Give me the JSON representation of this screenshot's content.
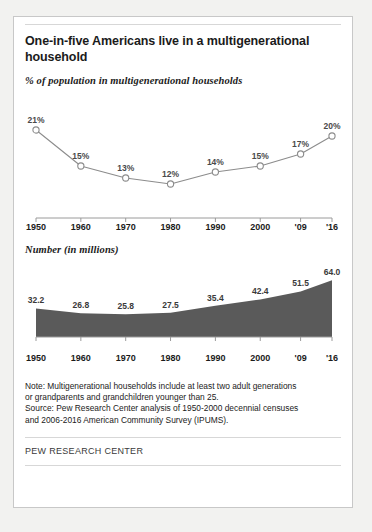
{
  "card": {
    "title": "One-in-five Americans live in a multigenerational household",
    "brand": "PEW RESEARCH CENTER"
  },
  "note": {
    "line1": "Note: Multigenerational households include at least two adult generations",
    "line2": "or grandparents and grandchildren younger than 25.",
    "line3": "Source: Pew Research Center analysis of 1950-2000 decennial censuses",
    "line4": "and 2006-2016 American Community Survey (IPUMS)."
  },
  "colors": {
    "line": "#8c8c8c",
    "marker_fill": "#ffffff",
    "area_fill": "#5a5a5a",
    "label": "#4a4a4a",
    "axis": "#9a9a9a",
    "card_border": "#c8c8c8"
  },
  "chart_data": [
    {
      "type": "line",
      "title": "% of population in multigenerational households",
      "xlabel": "",
      "ylabel": "",
      "categories": [
        "1950",
        "1960",
        "1970",
        "1980",
        "1990",
        "2000",
        "'09",
        "'16"
      ],
      "x": [
        1950,
        1960,
        1970,
        1980,
        1990,
        2000,
        2009,
        2016
      ],
      "values": [
        21,
        15,
        13,
        12,
        14,
        15,
        17,
        20
      ],
      "point_labels": [
        "21%",
        "15%",
        "13%",
        "12%",
        "14%",
        "15%",
        "17%",
        "20%"
      ],
      "ylim": [
        10,
        23
      ],
      "grid": false,
      "legend": "none",
      "marker": "open-circle"
    },
    {
      "type": "area",
      "title": "Number (in millions)",
      "xlabel": "",
      "ylabel": "",
      "categories": [
        "1950",
        "1960",
        "1970",
        "1980",
        "1990",
        "2000",
        "'09",
        "'16"
      ],
      "x": [
        1950,
        1960,
        1970,
        1980,
        1990,
        2000,
        2009,
        2016
      ],
      "values": [
        32.2,
        26.8,
        25.8,
        27.5,
        35.4,
        42.4,
        51.5,
        64.0
      ],
      "point_labels": [
        "32.2",
        "26.8",
        "25.8",
        "27.5",
        "35.4",
        "42.4",
        "51.5",
        "64.0"
      ],
      "ylim": [
        0,
        70
      ],
      "grid": false,
      "legend": "none"
    }
  ]
}
